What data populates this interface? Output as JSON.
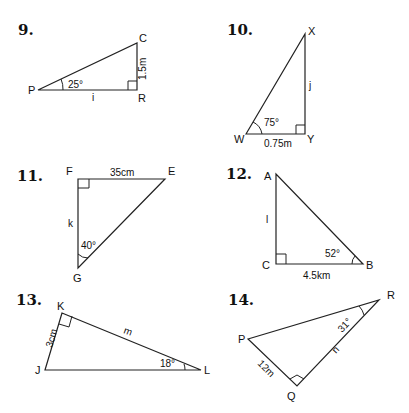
{
  "problems": [
    {
      "number": "9.",
      "vertices": {
        "P": "P",
        "C": "C",
        "R": "R"
      },
      "angle": "25°",
      "side_known": "1.5m",
      "side_unknown": "i"
    },
    {
      "number": "10.",
      "vertices": {
        "X": "X",
        "W": "W",
        "Y": "Y"
      },
      "angle": "75°",
      "side_known": "0.75m",
      "side_unknown": "j"
    },
    {
      "number": "11.",
      "vertices": {
        "F": "F",
        "E": "E",
        "G": "G"
      },
      "angle": "40°",
      "side_known": "35cm",
      "side_unknown": "k"
    },
    {
      "number": "12.",
      "vertices": {
        "A": "A",
        "C": "C",
        "B": "B"
      },
      "angle": "52°",
      "side_known": "4.5km",
      "side_unknown": "l"
    },
    {
      "number": "13.",
      "vertices": {
        "K": "K",
        "J": "J",
        "L": "L"
      },
      "angle": "18°",
      "side_known": "3cm",
      "side_unknown": "m"
    },
    {
      "number": "14.",
      "vertices": {
        "P": "P",
        "Q": "Q",
        "R": "R"
      },
      "angle": "31°",
      "side_known": "12m",
      "side_unknown": "n"
    }
  ]
}
